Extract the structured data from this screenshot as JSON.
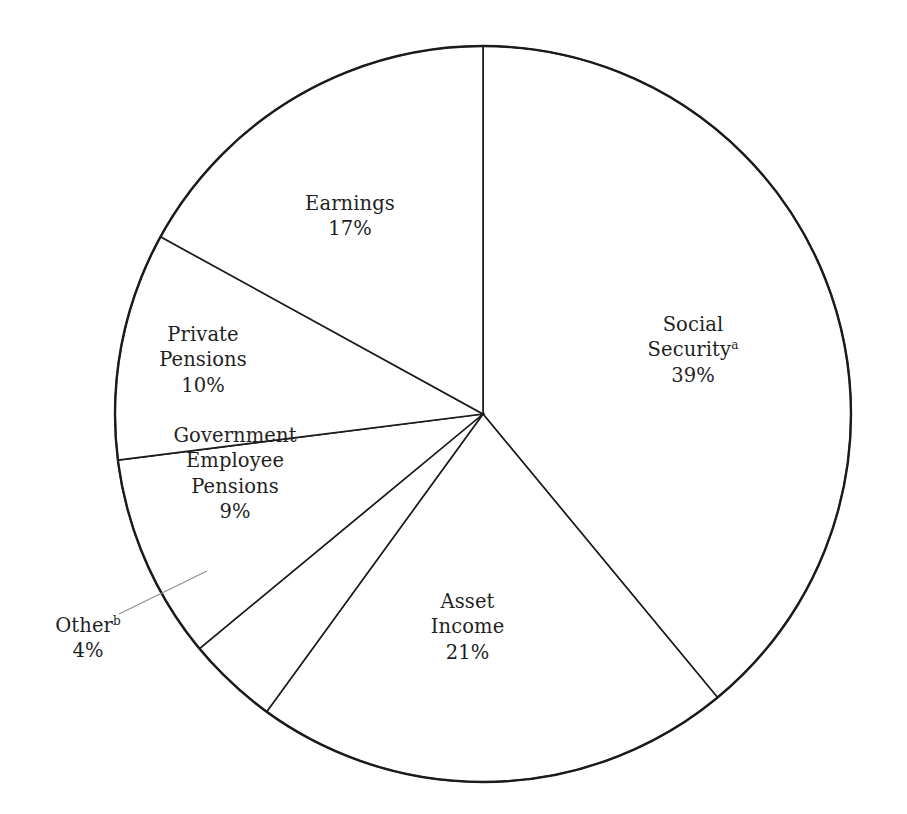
{
  "chart_data": {
    "type": "pie",
    "title": "",
    "subtitle": "",
    "xlabel": "",
    "ylabel": "",
    "legend_position": "none",
    "grid": false,
    "start_angle_deg": 0,
    "direction": "clockwise",
    "units": "percent",
    "total": 100,
    "categories": [
      "Social Security",
      "Asset Income",
      "Other",
      "Government Employee Pensions",
      "Private Pensions",
      "Earnings"
    ],
    "values": [
      39,
      21,
      4,
      9,
      10,
      17
    ],
    "labels": [
      "Social Securityᵃ 39%",
      "Asset Income 21%",
      "Otherᵇ 4%",
      "Government Employee Pensions 9%",
      "Private Pensions 10%",
      "Earnings 17%"
    ],
    "slices": [
      {
        "name": "Social Security",
        "value": 39,
        "percent_text": "39%",
        "footnote_mark": "a",
        "start_deg": 0,
        "end_deg": 140.4,
        "color": "#ffffff",
        "edge_color": "#1b1b1b"
      },
      {
        "name": "Asset Income",
        "value": 21,
        "percent_text": "21%",
        "footnote_mark": "",
        "start_deg": 140.4,
        "end_deg": 216.0,
        "color": "#ffffff",
        "edge_color": "#1b1b1b"
      },
      {
        "name": "Other",
        "value": 4,
        "percent_text": "4%",
        "footnote_mark": "b",
        "start_deg": 216.0,
        "end_deg": 230.4,
        "color": "#ffffff",
        "edge_color": "#1b1b1b"
      },
      {
        "name": "Government Employee Pensions",
        "value": 9,
        "percent_text": "9%",
        "footnote_mark": "",
        "start_deg": 230.4,
        "end_deg": 262.8,
        "color": "#ffffff",
        "edge_color": "#1b1b1b"
      },
      {
        "name": "Private Pensions",
        "value": 10,
        "percent_text": "10%",
        "footnote_mark": "",
        "start_deg": 262.8,
        "end_deg": 298.8,
        "color": "#ffffff",
        "edge_color": "#1b1b1b"
      },
      {
        "name": "Earnings",
        "value": 17,
        "percent_text": "17%",
        "footnote_mark": "",
        "start_deg": 298.8,
        "end_deg": 360.0,
        "color": "#ffffff",
        "edge_color": "#1b1b1b"
      }
    ]
  },
  "labels": {
    "earnings": {
      "name": "Earnings",
      "percent": "17%"
    },
    "social_security": {
      "name_line1": "Social",
      "name_line2": "Security",
      "footnote": "a",
      "percent": "39%"
    },
    "private_pensions": {
      "name_line1": "Private",
      "name_line2": "Pensions",
      "percent": "10%"
    },
    "government_pensions": {
      "name_line1": "Government",
      "name_line2": "Employee",
      "name_line3": "Pensions",
      "percent": "9%"
    },
    "other": {
      "name": "Other",
      "footnote": "b",
      "percent": "4%"
    },
    "asset_income": {
      "name_line1": "Asset",
      "name_line2": "Income",
      "percent": "21%"
    }
  },
  "geometry": {
    "center_x": 483,
    "center_y": 414,
    "radius": 368
  },
  "colors": {
    "stroke": "#1b1b1b",
    "leader": "#8e8e8e",
    "background": "#ffffff",
    "text": "#1f1f1f"
  }
}
